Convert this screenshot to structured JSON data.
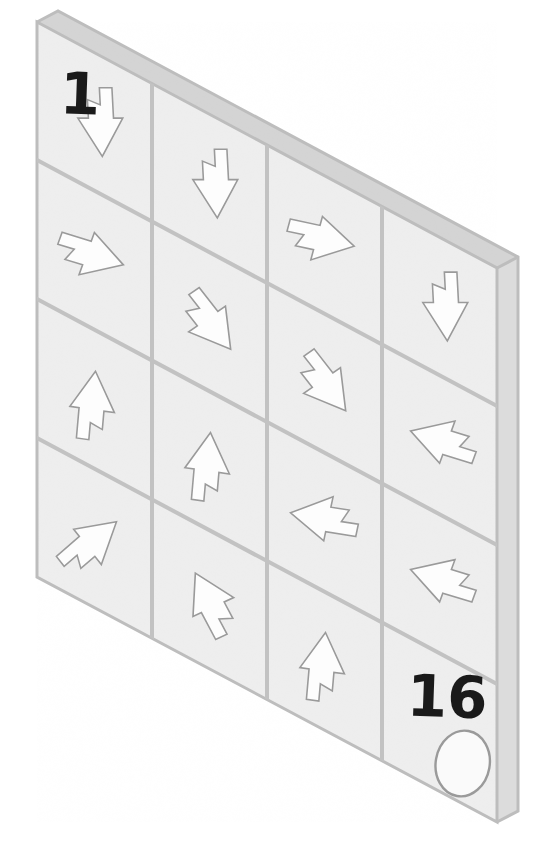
{
  "puzzle": {
    "title": "Arrow Maze Board",
    "board_type": "isometric-3d-tilted-grid",
    "rows": 4,
    "cols": 4,
    "start_label": "1",
    "end_label": "16",
    "goal_marker": "oval-token",
    "colors": {
      "face": "#eeeeee",
      "top_bevel": "#d4d4d4",
      "side_bevel": "#dcdcdc",
      "grid_line": "#c2c2c2",
      "arrow_fill": "#fdfdfd",
      "arrow_stroke": "#9a9a9a",
      "label_text": "#1a1a1a",
      "background": "#ffffff"
    },
    "geometry": {
      "face_top_left": [
        37,
        22
      ],
      "face_top_right": [
        497,
        268
      ],
      "face_bottom_right": [
        497,
        822
      ],
      "face_bottom_left": [
        37,
        577
      ],
      "depth_x": 21,
      "depth_y": -11
    }
  },
  "cells": [
    {
      "index": 1,
      "row": 1,
      "col": 1,
      "arrow": "down",
      "angle": 90,
      "label": "1",
      "marker": ""
    },
    {
      "index": 2,
      "row": 1,
      "col": 2,
      "arrow": "down",
      "angle": 90,
      "label": "",
      "marker": ""
    },
    {
      "index": 3,
      "row": 1,
      "col": 3,
      "arrow": "right",
      "angle": 15,
      "label": "",
      "marker": ""
    },
    {
      "index": 4,
      "row": 1,
      "col": 4,
      "arrow": "down",
      "angle": 90,
      "label": "",
      "marker": ""
    },
    {
      "index": 5,
      "row": 2,
      "col": 1,
      "arrow": "right",
      "angle": 20,
      "label": "",
      "marker": ""
    },
    {
      "index": 6,
      "row": 2,
      "col": 2,
      "arrow": "down-right",
      "angle": 55,
      "label": "",
      "marker": ""
    },
    {
      "index": 7,
      "row": 2,
      "col": 3,
      "arrow": "down-right",
      "angle": 55,
      "label": "",
      "marker": ""
    },
    {
      "index": 8,
      "row": 2,
      "col": 4,
      "arrow": "down-left",
      "angle": 200,
      "label": "",
      "marker": ""
    },
    {
      "index": 9,
      "row": 3,
      "col": 1,
      "arrow": "up",
      "angle": -82,
      "label": "",
      "marker": ""
    },
    {
      "index": 10,
      "row": 3,
      "col": 2,
      "arrow": "up",
      "angle": -82,
      "label": "",
      "marker": ""
    },
    {
      "index": 11,
      "row": 3,
      "col": 3,
      "arrow": "left",
      "angle": 192,
      "label": "",
      "marker": ""
    },
    {
      "index": 12,
      "row": 3,
      "col": 4,
      "arrow": "down-left",
      "angle": 200,
      "label": "",
      "marker": ""
    },
    {
      "index": 13,
      "row": 4,
      "col": 1,
      "arrow": "up-right",
      "angle": -38,
      "label": "",
      "marker": ""
    },
    {
      "index": 14,
      "row": 4,
      "col": 2,
      "arrow": "up-left",
      "angle": -115,
      "label": "",
      "marker": ""
    },
    {
      "index": 15,
      "row": 4,
      "col": 3,
      "arrow": "up",
      "angle": -82,
      "label": "",
      "marker": ""
    },
    {
      "index": 16,
      "row": 4,
      "col": 4,
      "arrow": "none",
      "angle": 0,
      "label": "16",
      "marker": "oval"
    }
  ],
  "chart_data": {
    "type": "table",
    "categories": [
      "col1",
      "col2",
      "col3",
      "col4"
    ],
    "rows": [
      "row1",
      "row2",
      "row3",
      "row4"
    ],
    "values": [
      [
        "down",
        "down",
        "right",
        "down"
      ],
      [
        "right",
        "down-right",
        "down-right",
        "down-left"
      ],
      [
        "up",
        "up",
        "left",
        "down-left"
      ],
      [
        "up-right",
        "up-left",
        "up",
        "none"
      ]
    ],
    "annotations": [
      {
        "cell": "row1col1",
        "text": "1"
      },
      {
        "cell": "row4col4",
        "text": "16"
      },
      {
        "cell": "row4col4",
        "text": "oval token"
      }
    ],
    "xlabel": "",
    "ylabel": "",
    "legend": []
  }
}
